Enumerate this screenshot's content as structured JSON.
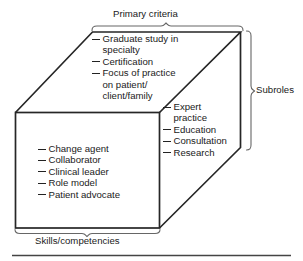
{
  "figure": {
    "title_top": "Primary criteria",
    "title_right": "Subroles",
    "title_bottom": "Skills/competencies"
  },
  "faces": {
    "top": {
      "name": "Primary criteria",
      "items": [
        {
          "lines": [
            "Graduate study in",
            "specialty"
          ]
        },
        {
          "lines": [
            "Certification"
          ]
        },
        {
          "lines": [
            "Focus of practice",
            "on patient/",
            "client/family"
          ]
        }
      ]
    },
    "right": {
      "name": "Subroles",
      "items": [
        {
          "lines": [
            "Expert",
            "practice"
          ]
        },
        {
          "lines": [
            "Education"
          ]
        },
        {
          "lines": [
            "Consultation"
          ]
        },
        {
          "lines": [
            "Research"
          ]
        }
      ]
    },
    "front": {
      "name": "Skills/competencies",
      "items": [
        {
          "lines": [
            "Change agent"
          ]
        },
        {
          "lines": [
            "Collaborator"
          ]
        },
        {
          "lines": [
            "Clinical leader"
          ]
        },
        {
          "lines": [
            "Role model"
          ]
        },
        {
          "lines": [
            "Patient advocate"
          ]
        }
      ]
    }
  },
  "colors": {
    "line": "#262626",
    "brace": "#555555",
    "text": "#1a1a1a",
    "rule": "#444444",
    "background": "#ffffff"
  }
}
